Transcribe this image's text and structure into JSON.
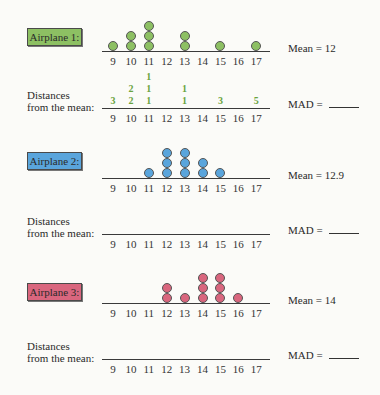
{
  "axis_ticks": [
    "9",
    "10",
    "11",
    "12",
    "13",
    "14",
    "15",
    "16",
    "17"
  ],
  "distances_label_line1": "Distances",
  "distances_label_line2": "from the mean:",
  "mad_label": "MAD =",
  "airplanes": [
    {
      "label": "Airplane 1:",
      "color": "#8dc063",
      "mean_text": "Mean = 12",
      "dot_counts": {
        "9": 1,
        "10": 2,
        "11": 3,
        "13": 2,
        "15": 1,
        "17": 1
      },
      "distances": {
        "9": [
          "3"
        ],
        "10": [
          "2",
          "2"
        ],
        "11": [
          "1",
          "1",
          "1"
        ],
        "13": [
          "1",
          "1"
        ],
        "15": [
          "3"
        ],
        "17": [
          "5"
        ]
      },
      "distance_color": "#6aa33e"
    },
    {
      "label": "Airplane 2:",
      "color": "#5aa5dc",
      "mean_text": "Mean = 12.9",
      "dot_counts": {
        "11": 1,
        "12": 3,
        "13": 3,
        "14": 2,
        "15": 1
      },
      "distances": {}
    },
    {
      "label": "Airplane 3:",
      "color": "#d9667e",
      "mean_text": "Mean = 14",
      "dot_counts": {
        "12": 2,
        "13": 1,
        "14": 3,
        "15": 3,
        "16": 1
      },
      "distances": {}
    }
  ],
  "chart_data": [
    {
      "type": "dot_plot",
      "title": "Airplane 1",
      "x": [
        9,
        10,
        11,
        12,
        13,
        14,
        15,
        16,
        17
      ],
      "values": [
        1,
        2,
        3,
        0,
        2,
        0,
        1,
        0,
        1
      ],
      "annotation": "Mean = 12",
      "distances_from_mean": {
        "9": [
          3
        ],
        "10": [
          2,
          2
        ],
        "11": [
          1,
          1,
          1
        ],
        "13": [
          1,
          1
        ],
        "15": [
          3
        ],
        "17": [
          5
        ]
      },
      "mad": ""
    },
    {
      "type": "dot_plot",
      "title": "Airplane 2",
      "x": [
        9,
        10,
        11,
        12,
        13,
        14,
        15,
        16,
        17
      ],
      "values": [
        0,
        0,
        1,
        3,
        3,
        2,
        1,
        0,
        0
      ],
      "annotation": "Mean = 12.9",
      "mad": ""
    },
    {
      "type": "dot_plot",
      "title": "Airplane 3",
      "x": [
        9,
        10,
        11,
        12,
        13,
        14,
        15,
        16,
        17
      ],
      "values": [
        0,
        0,
        0,
        2,
        1,
        3,
        3,
        1,
        0
      ],
      "annotation": "Mean = 14",
      "mad": ""
    }
  ]
}
